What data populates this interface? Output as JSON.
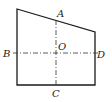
{
  "figure": {
    "type": "quadrilateral-with-axes",
    "labels": {
      "A": "A",
      "B": "B",
      "C": "C",
      "D": "D",
      "O": "O"
    },
    "colors": {
      "stroke": "#1a1a1a",
      "background": "#ffffff"
    }
  }
}
